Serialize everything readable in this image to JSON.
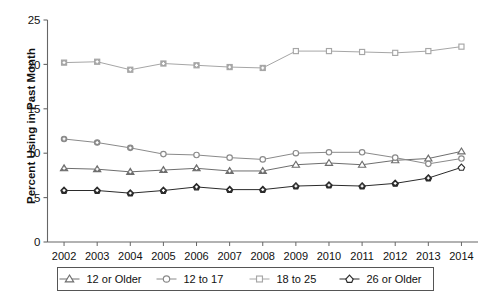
{
  "chart_data": {
    "type": "line",
    "title": "",
    "xlabel": "",
    "ylabel": "Percent Using in Past Month",
    "categories": [
      2002,
      2003,
      2004,
      2005,
      2006,
      2007,
      2008,
      2009,
      2010,
      2011,
      2012,
      2013,
      2014
    ],
    "xlim": [
      2001.5,
      2014.5
    ],
    "ylim": [
      0,
      25
    ],
    "yticks": [
      0,
      5,
      10,
      15,
      20,
      25
    ],
    "ytick_labels": [
      "0",
      "5",
      "10",
      "15",
      "20",
      "25"
    ],
    "xtick_labels": [
      "2002",
      "2003",
      "2004",
      "2005",
      "2006",
      "2007",
      "2008",
      "2009",
      "2010",
      "2011",
      "2012",
      "2013",
      "2014"
    ],
    "grid": false,
    "legend_position": "bottom",
    "series": [
      {
        "name": "12 or Older",
        "marker": "triangle",
        "color": "#6e6e6e",
        "values": [
          8.3,
          8.2,
          7.9,
          8.1,
          8.3,
          8.0,
          8.0,
          8.7,
          8.9,
          8.7,
          9.2,
          9.4,
          10.2
        ],
        "filled_through": 2008
      },
      {
        "name": "12 to 17",
        "marker": "circle",
        "color": "#8a8a8a",
        "values": [
          11.6,
          11.2,
          10.6,
          9.9,
          9.8,
          9.5,
          9.3,
          10.0,
          10.1,
          10.1,
          9.5,
          8.8,
          9.4
        ],
        "filled_through": 2004
      },
      {
        "name": "18 to 25",
        "marker": "square",
        "color": "#a6a6a6",
        "values": [
          20.2,
          20.3,
          19.4,
          20.1,
          19.9,
          19.7,
          19.6,
          21.5,
          21.5,
          21.4,
          21.3,
          21.5,
          22.0
        ],
        "filled_through": 2008
      },
      {
        "name": "26 or Older",
        "marker": "diamond",
        "color": "#2b2b2b",
        "values": [
          5.8,
          5.8,
          5.5,
          5.8,
          6.2,
          5.9,
          5.9,
          6.3,
          6.4,
          6.3,
          6.6,
          7.2,
          8.4
        ],
        "filled_through": 2013
      }
    ]
  },
  "axis": {
    "y_title": "Percent Using in Past Month"
  },
  "legend": {
    "items": [
      {
        "label": "12 or Older",
        "marker": "triangle"
      },
      {
        "label": "12 to 17",
        "marker": "circle"
      },
      {
        "label": "18 to 25",
        "marker": "square"
      },
      {
        "label": "26 or Older",
        "marker": "diamond"
      }
    ]
  },
  "caption": {
    "text": ""
  }
}
